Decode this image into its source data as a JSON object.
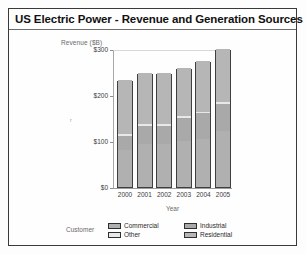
{
  "window": {
    "title": "US Electric Power - Revenue and Generation Sources"
  },
  "axis": {
    "y_title": "Revenue ($B)",
    "x_title": "Year",
    "y_ticks": [
      "$300",
      "$200",
      "$100",
      "$0"
    ]
  },
  "legend": {
    "title": "Customer",
    "items": [
      {
        "label": "Commercial",
        "color": "#b0b0b0"
      },
      {
        "label": "Industrial",
        "color": "#a9a9a9"
      },
      {
        "label": "Other",
        "color": "#e8e8e8"
      },
      {
        "label": "Residential",
        "color": "#b6b6b6"
      }
    ]
  },
  "chart_data": {
    "type": "bar",
    "subtype": "stacked",
    "title": "US Electric Power - Revenue and Generation Sources",
    "xlabel": "Year",
    "ylabel": "Revenue ($B)",
    "ylim": [
      0,
      300
    ],
    "ytick_values": [
      300,
      200,
      100,
      0
    ],
    "grid": false,
    "legend_position": "bottom",
    "legend_title": "Customer",
    "categories": [
      "2000",
      "2001",
      "2002",
      "2003",
      "2004",
      "2005"
    ],
    "series": [
      {
        "name": "Commercial",
        "color": "#b0b0b0",
        "values": [
          80,
          93,
          93,
          100,
          104,
          121
        ]
      },
      {
        "name": "Industrial",
        "color": "#a9a9a9",
        "values": [
          30,
          40,
          40,
          50,
          56,
          59
        ]
      },
      {
        "name": "Other",
        "color": "#e8e8e8",
        "values": [
          6,
          5,
          5,
          4,
          4,
          4
        ]
      },
      {
        "name": "Residential",
        "color": "#b6b6b6",
        "values": [
          117,
          110,
          110,
          105,
          111,
          116
        ]
      }
    ],
    "totals": [
      233,
      248,
      248,
      259,
      275,
      300
    ]
  }
}
